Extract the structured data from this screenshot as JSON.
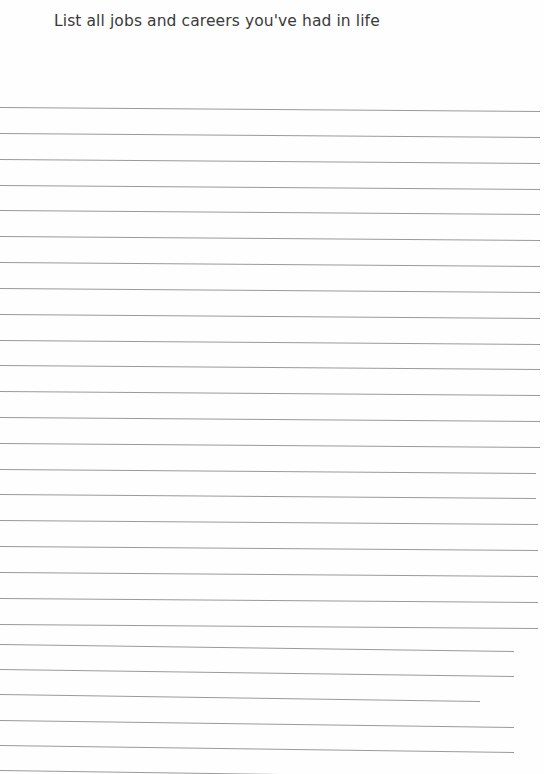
{
  "worksheet": {
    "title": "List all jobs and careers you've had in life",
    "line_count": 27,
    "line_color": "#9a9a9a",
    "text_color": "#3a3a3a",
    "background_color": "#fefefe",
    "lines": [
      {
        "y_left": 107,
        "y_right": 111,
        "x_end": 540
      },
      {
        "y_left": 133,
        "y_right": 137,
        "x_end": 540
      },
      {
        "y_left": 159,
        "y_right": 163,
        "x_end": 540
      },
      {
        "y_left": 185,
        "y_right": 189,
        "x_end": 540
      },
      {
        "y_left": 210,
        "y_right": 214,
        "x_end": 540
      },
      {
        "y_left": 236,
        "y_right": 240,
        "x_end": 540
      },
      {
        "y_left": 262,
        "y_right": 266,
        "x_end": 540
      },
      {
        "y_left": 288,
        "y_right": 292,
        "x_end": 540
      },
      {
        "y_left": 314,
        "y_right": 318,
        "x_end": 540
      },
      {
        "y_left": 340,
        "y_right": 344,
        "x_end": 540
      },
      {
        "y_left": 365,
        "y_right": 369,
        "x_end": 540
      },
      {
        "y_left": 391,
        "y_right": 395,
        "x_end": 540
      },
      {
        "y_left": 417,
        "y_right": 421,
        "x_end": 540
      },
      {
        "y_left": 443,
        "y_right": 447,
        "x_end": 540
      },
      {
        "y_left": 469,
        "y_right": 473,
        "x_end": 536
      },
      {
        "y_left": 494,
        "y_right": 498,
        "x_end": 536
      },
      {
        "y_left": 520,
        "y_right": 524,
        "x_end": 538
      },
      {
        "y_left": 546,
        "y_right": 550,
        "x_end": 538
      },
      {
        "y_left": 572,
        "y_right": 576,
        "x_end": 538
      },
      {
        "y_left": 598,
        "y_right": 602,
        "x_end": 538
      },
      {
        "y_left": 624,
        "y_right": 628,
        "x_end": 538
      },
      {
        "y_left": 644,
        "y_right": 651,
        "x_end": 514
      },
      {
        "y_left": 669,
        "y_right": 676,
        "x_end": 514
      },
      {
        "y_left": 694,
        "y_right": 701,
        "x_end": 480
      },
      {
        "y_left": 720,
        "y_right": 727,
        "x_end": 514
      },
      {
        "y_left": 745,
        "y_right": 752,
        "x_end": 514
      },
      {
        "y_left": 770,
        "y_right": 774,
        "x_end": 280
      }
    ]
  }
}
